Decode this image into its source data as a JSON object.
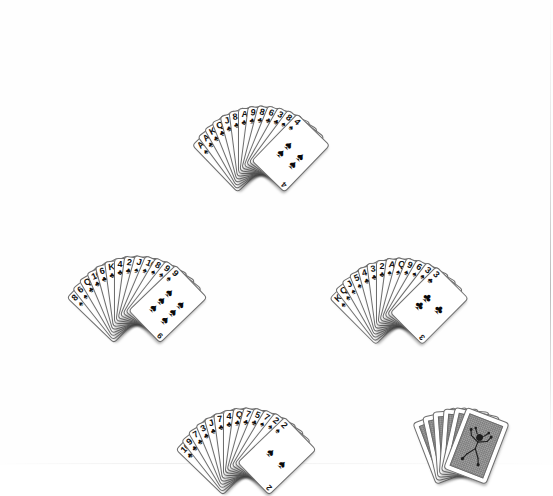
{
  "scene": {
    "title": "Bridge-style deal diagram",
    "background_color": "#ffffff",
    "card_back_color": "#9d9d9d",
    "card_face_color": "#ffffff",
    "ink_color": "#111111"
  },
  "hands": [
    {
      "id": "north",
      "label": "North",
      "card_count": 13,
      "fan_spread_degrees": 88,
      "cards": [
        {
          "rank": "A",
          "suit": "spades",
          "glyph": "♠"
        },
        {
          "rank": "A",
          "suit": "clubs",
          "glyph": "♣"
        },
        {
          "rank": "K",
          "suit": "clubs",
          "glyph": "♣"
        },
        {
          "rank": "Q",
          "suit": "clubs",
          "glyph": "♣"
        },
        {
          "rank": "J",
          "suit": "clubs",
          "glyph": "♣"
        },
        {
          "rank": "8",
          "suit": "clubs",
          "glyph": "♣"
        },
        {
          "rank": "A",
          "suit": "clubs",
          "glyph": "♣"
        },
        {
          "rank": "9",
          "suit": "clubs",
          "glyph": "♣"
        },
        {
          "rank": "8",
          "suit": "clubs",
          "glyph": "♣"
        },
        {
          "rank": "6",
          "suit": "clubs",
          "glyph": "♣"
        },
        {
          "rank": "3",
          "suit": "clubs",
          "glyph": "♣"
        },
        {
          "rank": "8",
          "suit": "spades",
          "glyph": "♠"
        },
        {
          "rank": "4",
          "suit": "spades",
          "glyph": "♠"
        }
      ]
    },
    {
      "id": "west",
      "label": "West",
      "card_count": 13,
      "fan_spread_degrees": 92,
      "cards": [
        {
          "rank": "8",
          "suit": "spades",
          "glyph": "♠"
        },
        {
          "rank": "6",
          "suit": "spades",
          "glyph": "♠"
        },
        {
          "rank": "Q",
          "suit": "clubs",
          "glyph": "♣"
        },
        {
          "rank": "10",
          "suit": "clubs",
          "glyph": "♣"
        },
        {
          "rank": "6",
          "suit": "clubs",
          "glyph": "♣"
        },
        {
          "rank": "K",
          "suit": "clubs",
          "glyph": "♣"
        },
        {
          "rank": "4",
          "suit": "clubs",
          "glyph": "♣"
        },
        {
          "rank": "2",
          "suit": "clubs",
          "glyph": "♣"
        },
        {
          "rank": "J",
          "suit": "spades",
          "glyph": "♠"
        },
        {
          "rank": "10",
          "suit": "spades",
          "glyph": "♠"
        },
        {
          "rank": "8",
          "suit": "spades",
          "glyph": "♠"
        },
        {
          "rank": "9",
          "suit": "spades",
          "glyph": "♠"
        },
        {
          "rank": "9",
          "suit": "spades",
          "glyph": "♠"
        }
      ]
    },
    {
      "id": "east",
      "label": "East",
      "card_count": 13,
      "fan_spread_degrees": 90,
      "cards": [
        {
          "rank": "K",
          "suit": "spades",
          "glyph": "♠"
        },
        {
          "rank": "Q",
          "suit": "spades",
          "glyph": "♠"
        },
        {
          "rank": "J",
          "suit": "spades",
          "glyph": "♠"
        },
        {
          "rank": "5",
          "suit": "spades",
          "glyph": "♠"
        },
        {
          "rank": "4",
          "suit": "clubs",
          "glyph": "♣"
        },
        {
          "rank": "3",
          "suit": "clubs",
          "glyph": "♣"
        },
        {
          "rank": "2",
          "suit": "clubs",
          "glyph": "♣"
        },
        {
          "rank": "A",
          "suit": "spades",
          "glyph": "♠"
        },
        {
          "rank": "Q",
          "suit": "spades",
          "glyph": "♠"
        },
        {
          "rank": "9",
          "suit": "spades",
          "glyph": "♠"
        },
        {
          "rank": "6",
          "suit": "spades",
          "glyph": "♠"
        },
        {
          "rank": "3",
          "suit": "spades",
          "glyph": "♠"
        },
        {
          "rank": "3",
          "suit": "clubs",
          "glyph": "♣"
        }
      ]
    },
    {
      "id": "south",
      "label": "South",
      "card_count": 13,
      "fan_spread_degrees": 92,
      "cards": [
        {
          "rank": "10",
          "suit": "clubs",
          "glyph": "♣"
        },
        {
          "rank": "9",
          "suit": "clubs",
          "glyph": "♣"
        },
        {
          "rank": "7",
          "suit": "clubs",
          "glyph": "♣"
        },
        {
          "rank": "3",
          "suit": "clubs",
          "glyph": "♣"
        },
        {
          "rank": "J",
          "suit": "clubs",
          "glyph": "♣"
        },
        {
          "rank": "7",
          "suit": "clubs",
          "glyph": "♣"
        },
        {
          "rank": "4",
          "suit": "clubs",
          "glyph": "♣"
        },
        {
          "rank": "Q",
          "suit": "clubs",
          "glyph": "♣"
        },
        {
          "rank": "7",
          "suit": "clubs",
          "glyph": "♣"
        },
        {
          "rank": "5",
          "suit": "clubs",
          "glyph": "♣"
        },
        {
          "rank": "7",
          "suit": "spades",
          "glyph": "♠"
        },
        {
          "rank": "2",
          "suit": "spades",
          "glyph": "♠"
        },
        {
          "rank": "2",
          "suit": "spades",
          "glyph": "♠"
        }
      ]
    }
  ],
  "cachette": {
    "id": "cachette",
    "label": "Cachette",
    "card_count": 6,
    "face_down": true,
    "back_design": "jester-figure",
    "fan_spread_degrees": 42
  },
  "labels": {
    "north": "North",
    "west": "West",
    "east": "East",
    "south": "South",
    "cachette": "Cachette"
  }
}
